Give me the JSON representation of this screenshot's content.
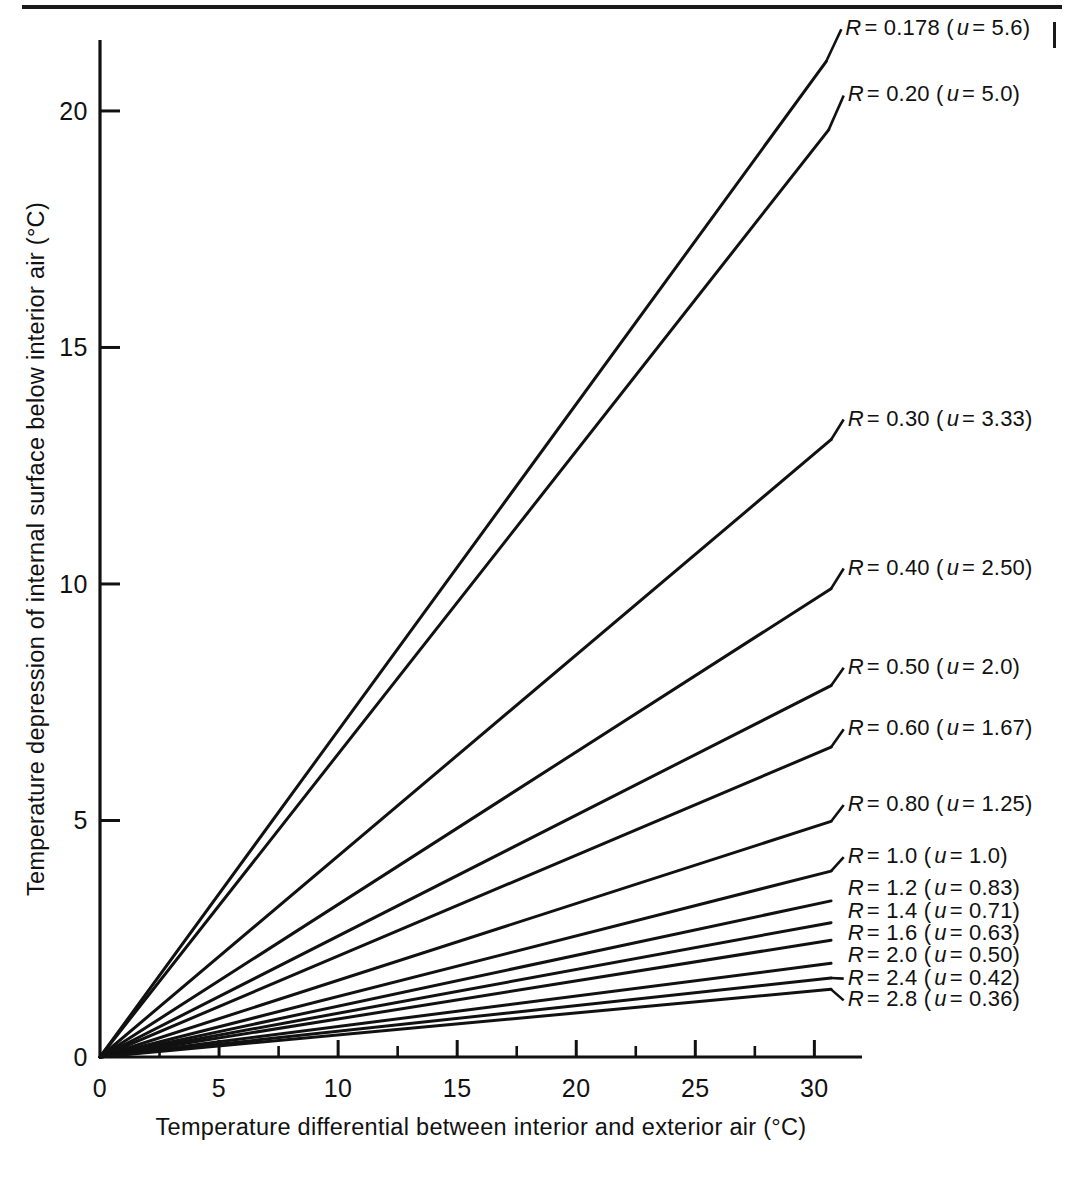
{
  "figure": {
    "background_color": "#ffffff",
    "ink_color": "#111111"
  },
  "chart_data": {
    "type": "line",
    "title": "",
    "xlabel": "Temperature differential between interior and exterior air  (°C)",
    "ylabel": "Temperature depression of internal surface below interior air  (°C)",
    "xlim": [
      0,
      32
    ],
    "ylim": [
      0,
      21.5
    ],
    "xticks": [
      0,
      5,
      10,
      15,
      20,
      25,
      30
    ],
    "xtick_labels": [
      "0",
      "5",
      "10",
      "15",
      "20",
      "25",
      "30"
    ],
    "x_minor_tick_step": 2.5,
    "yticks": [
      0,
      5,
      10,
      15,
      20
    ],
    "ytick_labels": [
      "0",
      "5",
      "10",
      "15",
      "20"
    ],
    "grid": false,
    "legend": "inline-end-of-line",
    "series": [
      {
        "name": "R = 0.178 (u = 5.6)",
        "label": "R = 0.178 (u = 5.6)",
        "R": 0.178,
        "u": 5.6,
        "slope": 0.69,
        "x_end": 30.5,
        "y_end": 21.05,
        "label_x": 31.3,
        "label_y": 21.6
      },
      {
        "name": "R = 0.20 (u = 5.0)",
        "label": "R = 0.20 (u = 5.0)",
        "R": 0.2,
        "u": 5.0,
        "slope": 0.64,
        "x_end": 30.6,
        "y_end": 19.6,
        "label_x": 31.4,
        "label_y": 20.2
      },
      {
        "name": "R = 0.30 (u = 3.33)",
        "label": "R = 0.30 (u = 3.33)",
        "R": 0.3,
        "u": 3.33,
        "slope": 0.425,
        "x_end": 30.7,
        "y_end": 13.05,
        "label_x": 31.4,
        "label_y": 13.35
      },
      {
        "name": "R = 0.40 (u = 2.50)",
        "label": "R = 0.40 (u = 2.50)",
        "R": 0.4,
        "u": 2.5,
        "slope": 0.322,
        "x_end": 30.7,
        "y_end": 9.9,
        "label_x": 31.4,
        "label_y": 10.2
      },
      {
        "name": "R = 0.50 (u = 2.0)",
        "label": "R = 0.50 (u = 2.0)",
        "R": 0.5,
        "u": 2.0,
        "slope": 0.255,
        "x_end": 30.7,
        "y_end": 7.85,
        "label_x": 31.4,
        "label_y": 8.1
      },
      {
        "name": "R = 0.60 (u = 1.67)",
        "label": "R = 0.60 (u = 1.67)",
        "R": 0.6,
        "u": 1.67,
        "slope": 0.213,
        "x_end": 30.7,
        "y_end": 6.55,
        "label_x": 31.4,
        "label_y": 6.8
      },
      {
        "name": "R = 0.80 (u = 1.25)",
        "label": "R = 0.80 (u = 1.25)",
        "R": 0.8,
        "u": 1.25,
        "slope": 0.162,
        "x_end": 30.7,
        "y_end": 4.98,
        "label_x": 31.4,
        "label_y": 5.2
      },
      {
        "name": "R = 1.0 (u = 1.0)",
        "label": "R = 1.0 ( u = 1.0)",
        "R": 1.0,
        "u": 1.0,
        "slope": 0.128,
        "x_end": 30.7,
        "y_end": 3.93,
        "label_x": 31.4,
        "label_y": 4.1
      },
      {
        "name": "R = 1.2 (u = 0.83)",
        "label": "R = 1.2 (u = 0.83)",
        "R": 1.2,
        "u": 0.83,
        "slope": 0.1075,
        "x_end": 30.7,
        "y_end": 3.3,
        "label_x": 31.4,
        "label_y": 3.42
      },
      {
        "name": "R = 1.4 (u = 0.71)",
        "label": "R = 1.4 (u = 0.71)",
        "R": 1.4,
        "u": 0.71,
        "slope": 0.0925,
        "x_end": 30.7,
        "y_end": 2.84,
        "label_x": 31.4,
        "label_y": 2.93
      },
      {
        "name": "R = 1.6 (u = 0.63)",
        "label": "R = 1.6 (u = 0.63)",
        "R": 1.6,
        "u": 0.63,
        "slope": 0.0805,
        "x_end": 30.7,
        "y_end": 2.47,
        "label_x": 31.4,
        "label_y": 2.48
      },
      {
        "name": "R = 2.0 (u = 0.50)",
        "label": "R = 2.0 (u = 0.50)",
        "R": 2.0,
        "u": 0.5,
        "slope": 0.0645,
        "x_end": 30.7,
        "y_end": 1.98,
        "label_x": 31.4,
        "label_y": 2.0
      },
      {
        "name": "R = 2.4 (u = 0.42)",
        "label": "R = 2.4 (u = 0.42)",
        "R": 2.4,
        "u": 0.42,
        "slope": 0.0545,
        "x_end": 30.7,
        "y_end": 1.67,
        "label_x": 31.4,
        "label_y": 1.53
      },
      {
        "name": "R = 2.8 (u = 0.36)",
        "label": "R = 2.8 (u = 0.36)",
        "R": 2.8,
        "u": 0.36,
        "slope": 0.0465,
        "x_end": 30.7,
        "y_end": 1.43,
        "label_x": 31.4,
        "label_y": 1.07
      }
    ]
  }
}
